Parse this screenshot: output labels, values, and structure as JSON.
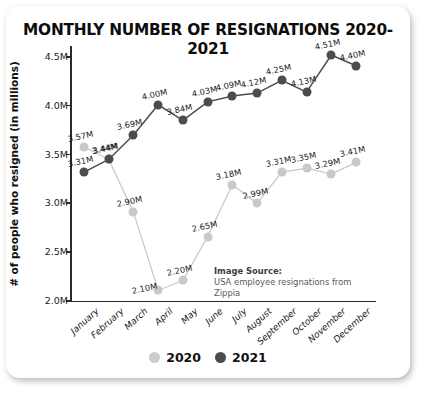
{
  "chart_data": {
    "type": "line",
    "title": "MONTHLY NUMBER OF RESIGNATIONS 2020-2021",
    "xlabel": "",
    "ylabel": "# of people who resigned (in millions)",
    "ylim": [
      2.0,
      4.5
    ],
    "yticks": [
      "2.0M",
      "2.5M",
      "3.0M",
      "3.5M",
      "4.0M",
      "4.5M"
    ],
    "ytick_values": [
      2.0,
      2.5,
      3.0,
      3.5,
      4.0,
      4.5
    ],
    "grid": false,
    "legend_position": "bottom",
    "categories": [
      "January",
      "February",
      "March",
      "April",
      "May",
      "June",
      "July",
      "August",
      "September",
      "October",
      "November",
      "December"
    ],
    "series": [
      {
        "name": "2020",
        "color": "#c9c9c9",
        "values": [
          3.57,
          3.44,
          2.9,
          2.1,
          2.2,
          2.65,
          3.18,
          2.99,
          3.31,
          3.35,
          3.29,
          3.41
        ],
        "labels": [
          "3.57M",
          "3.44M",
          "2.90M",
          "2.10M",
          "2.20M",
          "2.65M",
          "3.18M",
          "2.99M",
          "3.31M",
          "3.35M",
          "3.29M",
          "3.41M"
        ]
      },
      {
        "name": "2021",
        "color": "#4c4c4c",
        "values": [
          3.31,
          3.44,
          3.69,
          4.0,
          3.84,
          4.03,
          4.09,
          4.12,
          4.25,
          4.13,
          4.51,
          4.4
        ],
        "labels": [
          "3.31M",
          "3.44M",
          "3.69M",
          "4.00M",
          "3.84M",
          "4.03M",
          "4.09M",
          "4.12M",
          "4.25M",
          "4.13M",
          "4.51M",
          "4.40M"
        ]
      }
    ],
    "annotations": {
      "source_heading": "Image Source:",
      "source_text": "USA employee resignations from Zippia"
    }
  },
  "legend": [
    {
      "label": "2020"
    },
    {
      "label": "2021"
    }
  ]
}
